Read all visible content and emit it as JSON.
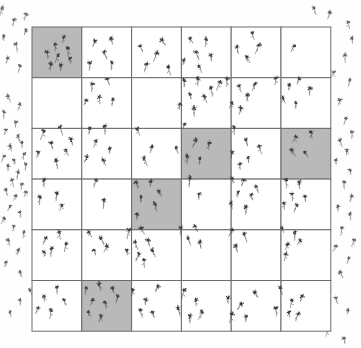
{
  "figure": {
    "type": "quadrat-sampling-diagram",
    "title": "",
    "caption": "",
    "background_color": "#fefefe"
  },
  "grid": {
    "name": "quadrat-grid",
    "rows": 6,
    "cols": 6,
    "x": 32,
    "y": 27,
    "width": 299,
    "height": 304,
    "cell_width": 49.8,
    "cell_height": 50.7,
    "line_color": "#6b6b6b",
    "line_width": 1,
    "cell_fill": "#ffffff",
    "shaded_fill": "#b9b9b9"
  },
  "legend": {
    "shaded_meaning": "selected quadrat",
    "plain_meaning": "unselected quadrat",
    "symbol_meaning": "plant"
  },
  "chart_data": {
    "type": "scatter",
    "xlabel": "",
    "ylabel": "",
    "grid": true,
    "legend_position": "none",
    "rows": 6,
    "cols": 6,
    "selected_cells": [
      {
        "row": 1,
        "col": 1
      },
      {
        "row": 3,
        "col": 4
      },
      {
        "row": 3,
        "col": 6
      },
      {
        "row": 4,
        "col": 3
      },
      {
        "row": 6,
        "col": 2
      }
    ],
    "counts": [
      [
        8,
        5,
        5,
        6,
        4,
        1
      ],
      [
        0,
        5,
        0,
        8,
        6,
        6
      ],
      [
        7,
        6,
        3,
        6,
        6,
        4
      ],
      [
        4,
        2,
        6,
        2,
        7,
        6
      ],
      [
        5,
        4,
        8,
        4,
        3,
        5
      ],
      [
        5,
        8,
        5,
        5,
        5,
        6
      ]
    ],
    "total_inside": 182,
    "points_inside": [
      [
        55,
        44
      ],
      [
        64,
        37
      ],
      [
        47,
        52
      ],
      [
        58,
        55
      ],
      [
        68,
        48
      ],
      [
        51,
        64
      ],
      [
        61,
        65
      ],
      [
        70,
        58
      ],
      [
        95,
        41
      ],
      [
        111,
        38
      ],
      [
        104,
        52
      ],
      [
        90,
        63
      ],
      [
        112,
        63
      ],
      [
        140,
        46
      ],
      [
        157,
        53
      ],
      [
        147,
        64
      ],
      [
        162,
        40
      ],
      [
        168,
        67
      ],
      [
        190,
        38
      ],
      [
        206,
        39
      ],
      [
        196,
        52
      ],
      [
        211,
        55
      ],
      [
        199,
        66
      ],
      [
        184,
        60
      ],
      [
        252,
        33
      ],
      [
        237,
        47
      ],
      [
        247,
        57
      ],
      [
        259,
        45
      ],
      [
        294,
        46
      ],
      [
        92,
        84
      ],
      [
        107,
        79
      ],
      [
        99,
        97
      ],
      [
        113,
        99
      ],
      [
        86,
        100
      ],
      [
        184,
        80
      ],
      [
        198,
        79
      ],
      [
        190,
        94
      ],
      [
        204,
        96
      ],
      [
        180,
        104
      ],
      [
        194,
        108
      ],
      [
        211,
        88
      ],
      [
        220,
        82
      ],
      [
        227,
        79
      ],
      [
        239,
        86
      ],
      [
        247,
        95
      ],
      [
        232,
        103
      ],
      [
        255,
        84
      ],
      [
        241,
        108
      ],
      [
        276,
        78
      ],
      [
        289,
        85
      ],
      [
        299,
        79
      ],
      [
        283,
        98
      ],
      [
        296,
        103
      ],
      [
        310,
        88
      ],
      [
        44,
        131
      ],
      [
        60,
        127
      ],
      [
        51,
        143
      ],
      [
        66,
        150
      ],
      [
        38,
        152
      ],
      [
        56,
        160
      ],
      [
        71,
        139
      ],
      [
        90,
        128
      ],
      [
        105,
        126
      ],
      [
        96,
        141
      ],
      [
        110,
        148
      ],
      [
        87,
        157
      ],
      [
        103,
        160
      ],
      [
        137,
        129
      ],
      [
        152,
        147
      ],
      [
        144,
        158
      ],
      [
        185,
        124
      ],
      [
        196,
        140
      ],
      [
        209,
        143
      ],
      [
        187,
        156
      ],
      [
        200,
        158
      ],
      [
        176,
        148
      ],
      [
        234,
        127
      ],
      [
        246,
        140
      ],
      [
        232,
        152
      ],
      [
        248,
        158
      ],
      [
        259,
        146
      ],
      [
        240,
        164
      ],
      [
        296,
        137
      ],
      [
        311,
        132
      ],
      [
        292,
        150
      ],
      [
        305,
        152
      ],
      [
        44,
        180
      ],
      [
        57,
        193
      ],
      [
        40,
        197
      ],
      [
        62,
        205
      ],
      [
        96,
        180
      ],
      [
        104,
        200
      ],
      [
        136,
        182
      ],
      [
        151,
        181
      ],
      [
        159,
        191
      ],
      [
        141,
        197
      ],
      [
        155,
        204
      ],
      [
        137,
        214
      ],
      [
        190,
        178
      ],
      [
        199,
        194
      ],
      [
        232,
        178
      ],
      [
        244,
        180
      ],
      [
        238,
        192
      ],
      [
        251,
        195
      ],
      [
        231,
        203
      ],
      [
        246,
        207
      ],
      [
        256,
        186
      ],
      [
        286,
        180
      ],
      [
        299,
        182
      ],
      [
        292,
        194
      ],
      [
        305,
        196
      ],
      [
        284,
        203
      ],
      [
        297,
        205
      ],
      [
        46,
        238
      ],
      [
        59,
        232
      ],
      [
        52,
        248
      ],
      [
        66,
        244
      ],
      [
        44,
        252
      ],
      [
        89,
        232
      ],
      [
        101,
        238
      ],
      [
        94,
        250
      ],
      [
        107,
        246
      ],
      [
        129,
        230
      ],
      [
        141,
        228
      ],
      [
        135,
        242
      ],
      [
        148,
        240
      ],
      [
        127,
        250
      ],
      [
        139,
        254
      ],
      [
        152,
        250
      ],
      [
        144,
        260
      ],
      [
        181,
        228
      ],
      [
        195,
        226
      ],
      [
        188,
        238
      ],
      [
        200,
        242
      ],
      [
        232,
        230
      ],
      [
        244,
        234
      ],
      [
        236,
        246
      ],
      [
        282,
        228
      ],
      [
        295,
        232
      ],
      [
        288,
        244
      ],
      [
        300,
        240
      ],
      [
        286,
        254
      ],
      [
        44,
        296
      ],
      [
        57,
        287
      ],
      [
        38,
        308
      ],
      [
        51,
        310
      ],
      [
        64,
        300
      ],
      [
        86,
        288
      ],
      [
        99,
        284
      ],
      [
        112,
        288
      ],
      [
        93,
        300
      ],
      [
        105,
        302
      ],
      [
        88,
        312
      ],
      [
        101,
        316
      ],
      [
        118,
        296
      ],
      [
        133,
        290
      ],
      [
        146,
        300
      ],
      [
        158,
        286
      ],
      [
        140,
        310
      ],
      [
        152,
        312
      ],
      [
        184,
        290
      ],
      [
        196,
        300
      ],
      [
        178,
        308
      ],
      [
        190,
        316
      ],
      [
        202,
        312
      ],
      [
        228,
        298
      ],
      [
        241,
        304
      ],
      [
        232,
        314
      ],
      [
        246,
        316
      ],
      [
        255,
        292
      ],
      [
        280,
        288
      ],
      [
        292,
        300
      ],
      [
        276,
        308
      ],
      [
        289,
        312
      ],
      [
        302,
        296
      ],
      [
        298,
        314
      ]
    ],
    "points_outside": [
      [
        314,
        8
      ],
      [
        330,
        12
      ],
      [
        348,
        22
      ],
      [
        352,
        38
      ],
      [
        345,
        55
      ],
      [
        334,
        72
      ],
      [
        350,
        80
      ],
      [
        340,
        100
      ],
      [
        346,
        118
      ],
      [
        352,
        132
      ],
      [
        340,
        140
      ],
      [
        347,
        150
      ],
      [
        336,
        160
      ],
      [
        350,
        170
      ],
      [
        344,
        182
      ],
      [
        352,
        196
      ],
      [
        338,
        206
      ],
      [
        350,
        214
      ],
      [
        342,
        228
      ],
      [
        354,
        240
      ],
      [
        336,
        246
      ],
      [
        349,
        258
      ],
      [
        340,
        272
      ],
      [
        8,
        96
      ],
      [
        20,
        104
      ],
      [
        4,
        112
      ],
      [
        16,
        122
      ],
      [
        6,
        130
      ],
      [
        18,
        136
      ],
      [
        10,
        146
      ],
      [
        22,
        142
      ],
      [
        4,
        156
      ],
      [
        14,
        160
      ],
      [
        24,
        154
      ],
      [
        8,
        166
      ],
      [
        18,
        172
      ],
      [
        26,
        164
      ],
      [
        12,
        180
      ],
      [
        22,
        184
      ],
      [
        6,
        190
      ],
      [
        16,
        196
      ],
      [
        26,
        192
      ],
      [
        10,
        206
      ],
      [
        20,
        212
      ],
      [
        4,
        218
      ],
      [
        14,
        226
      ],
      [
        24,
        232
      ],
      [
        8,
        240
      ],
      [
        18,
        250
      ],
      [
        6,
        262
      ],
      [
        20,
        272
      ],
      [
        2,
        8
      ],
      [
        14,
        20
      ],
      [
        26,
        14
      ],
      [
        4,
        36
      ],
      [
        16,
        44
      ],
      [
        26,
        30
      ],
      [
        8,
        58
      ],
      [
        20,
        66
      ],
      [
        30,
        290
      ],
      [
        20,
        300
      ],
      [
        10,
        312
      ],
      [
        336,
        298
      ],
      [
        348,
        310
      ],
      [
        328,
        330
      ],
      [
        344,
        338
      ]
    ]
  },
  "annotations": {
    "shaded_cell_label": "sampled quadrat",
    "plant_symbol_label": "plant"
  }
}
